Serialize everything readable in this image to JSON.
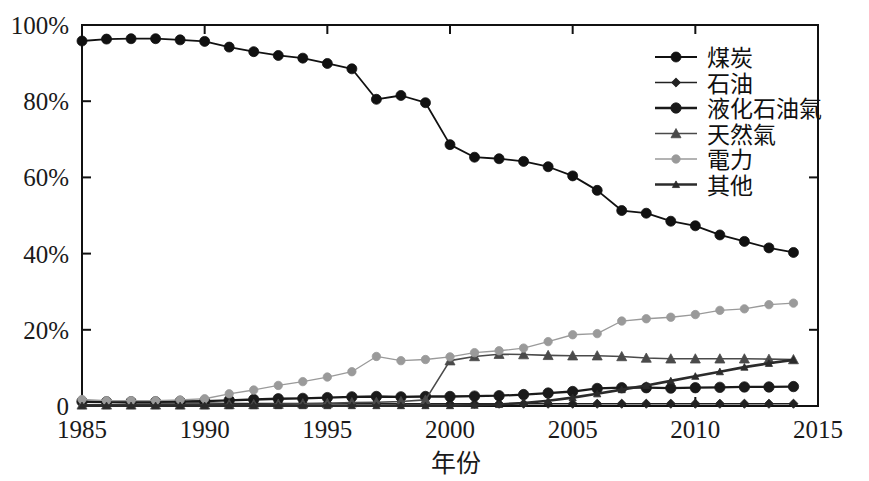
{
  "chart_data": {
    "type": "line",
    "title": "",
    "xlabel": "年份",
    "ylabel": "",
    "xlim": [
      1985,
      2015
    ],
    "ylim": [
      0,
      100
    ],
    "grid": false,
    "legend_position": "top-right",
    "x_tick_labels": [
      "1985",
      "1990",
      "1995",
      "2000",
      "2005",
      "2010",
      "2015"
    ],
    "x_tick_values": [
      1985,
      1990,
      1995,
      2000,
      2005,
      2010,
      2015
    ],
    "y_tick_labels": [
      "0",
      "20%",
      "40%",
      "60%",
      "80%",
      "100%"
    ],
    "y_tick_values": [
      0,
      20,
      40,
      60,
      80,
      100
    ],
    "x": [
      1985,
      1986,
      1987,
      1988,
      1989,
      1990,
      1991,
      1992,
      1993,
      1994,
      1995,
      1996,
      1997,
      1998,
      1999,
      2000,
      2001,
      2002,
      2003,
      2004,
      2005,
      2006,
      2007,
      2008,
      2009,
      2010,
      2011,
      2012,
      2013,
      2014
    ],
    "series": [
      {
        "name": "煤炭",
        "color": "#111111",
        "marker": "circle",
        "marker_size": 5.0,
        "line_width": 1.8,
        "values": [
          95.8,
          96.3,
          96.4,
          96.4,
          96.1,
          95.7,
          94.2,
          93.0,
          92.0,
          91.3,
          89.9,
          88.5,
          80.5,
          81.5,
          79.6,
          68.6,
          65.3,
          64.9,
          64.2,
          62.8,
          60.4,
          56.6,
          51.3,
          50.6,
          48.5,
          47.3,
          44.9,
          43.2,
          41.5,
          40.3
        ]
      },
      {
        "name": "石油",
        "color": "#222222",
        "marker": "diamond",
        "marker_size": 3.2,
        "line_width": 1.4,
        "values": [
          1.0,
          0.9,
          0.8,
          0.8,
          0.8,
          0.8,
          0.7,
          0.7,
          0.7,
          0.7,
          0.7,
          0.7,
          0.7,
          0.6,
          0.6,
          0.6,
          0.6,
          0.6,
          0.6,
          0.6,
          0.6,
          0.6,
          0.6,
          0.6,
          0.6,
          0.6,
          0.6,
          0.6,
          0.6,
          0.6
        ]
      },
      {
        "name": "液化石油氣",
        "color": "#1a1a1a",
        "marker": "circle",
        "marker_size": 5.2,
        "line_width": 2.3,
        "values": [
          1.2,
          1.1,
          1.1,
          1.1,
          1.2,
          1.3,
          1.5,
          1.7,
          1.9,
          2.0,
          2.2,
          2.4,
          2.5,
          2.4,
          2.5,
          2.5,
          2.6,
          2.7,
          3.0,
          3.4,
          3.8,
          4.6,
          4.8,
          4.8,
          4.7,
          4.8,
          4.9,
          5.0,
          5.0,
          5.1
        ]
      },
      {
        "name": "天然氣",
        "color": "#4a4a4a",
        "marker": "triangle",
        "marker_size": 5.0,
        "line_width": 1.6,
        "values": [
          0.3,
          0.3,
          0.3,
          0.3,
          0.3,
          0.3,
          0.4,
          0.4,
          0.5,
          0.6,
          0.7,
          0.9,
          1.0,
          1.2,
          1.6,
          11.9,
          13.0,
          13.6,
          13.5,
          13.3,
          13.2,
          13.2,
          13.0,
          12.6,
          12.4,
          12.4,
          12.4,
          12.4,
          12.3,
          12.2
        ]
      },
      {
        "name": "電力",
        "color": "#9a9a9a",
        "marker": "circle",
        "marker_size": 4.2,
        "line_width": 1.3,
        "values": [
          1.7,
          1.4,
          1.4,
          1.4,
          1.6,
          1.9,
          3.2,
          4.2,
          5.4,
          6.4,
          7.6,
          9.0,
          13.0,
          11.9,
          12.2,
          12.9,
          14.0,
          14.5,
          15.2,
          16.9,
          18.7,
          19.0,
          22.3,
          22.9,
          23.3,
          24.0,
          25.1,
          25.5,
          26.6,
          27.0
        ]
      },
      {
        "name": "其他",
        "color": "#2b2b2b",
        "marker": "triangle",
        "marker_size": 3.6,
        "line_width": 2.6,
        "values": [
          0.1,
          0.1,
          0.1,
          0.1,
          0.1,
          0.1,
          0.1,
          0.1,
          0.1,
          0.1,
          0.1,
          0.1,
          0.1,
          0.1,
          0.1,
          0.1,
          0.2,
          0.4,
          0.8,
          1.4,
          2.2,
          3.2,
          4.3,
          5.4,
          6.6,
          7.8,
          9.0,
          10.2,
          11.2,
          12.1
        ]
      }
    ]
  },
  "legend": {
    "items": [
      {
        "label": "煤炭"
      },
      {
        "label": "石油"
      },
      {
        "label": "液化石油氣"
      },
      {
        "label": "天然氣"
      },
      {
        "label": "電力"
      },
      {
        "label": "其他"
      }
    ]
  },
  "axes": {
    "x_title": "年份"
  }
}
